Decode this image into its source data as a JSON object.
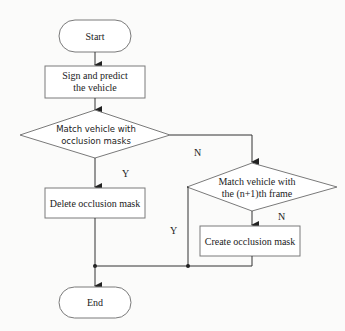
{
  "flowchart": {
    "start": {
      "label": "Start"
    },
    "sign_predict": {
      "line1": "Sign and predict",
      "line2": "the vehicle"
    },
    "decision_masks": {
      "line1": "Match vehicle with",
      "line2": "occlusion masks"
    },
    "delete_mask": {
      "label": "Delete occlusion mask"
    },
    "decision_frame": {
      "line1": "Match vehicle with",
      "line2": "the (n+1)th frame"
    },
    "create_mask": {
      "label": "Create occlusion mask"
    },
    "end": {
      "label": "End"
    },
    "edge_labels": {
      "masks_no": "N",
      "masks_yes": "Y",
      "frame_yes": "Y",
      "frame_no": "N"
    },
    "colors": {
      "stroke": "#7a7a7a",
      "line": "#333333",
      "background": "#fbfbfa"
    }
  }
}
